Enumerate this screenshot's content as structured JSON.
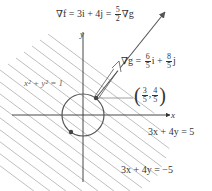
{
  "diagram": {
    "title_label": {
      "lhs": "∇f = 3i + 4j =",
      "frac_num": "5",
      "frac_den": "2",
      "rhs": "∇g"
    },
    "grad_g_label": {
      "lhs": "∇g =",
      "frac1_num": "6",
      "frac1_den": "5",
      "mid": "i +",
      "frac2_num": "8",
      "frac2_den": "5",
      "rhs": "j"
    },
    "circle_label": "x² + y² = 1",
    "point_label": {
      "open": "(",
      "x_num": "3",
      "x_den": "5",
      "sep": ",",
      "y_num": "4",
      "y_den": "5",
      "close": ")"
    },
    "line_upper_label": "3x + 4y = 5",
    "line_lower_label": "3x + 4y = −5",
    "axis_x_label": "x",
    "axis_y_label": "y",
    "colors": {
      "axis": "#333333",
      "hatch": "#b5b5b5",
      "circle": "#555555",
      "arrow": "#555555",
      "text": "#333333"
    }
  }
}
